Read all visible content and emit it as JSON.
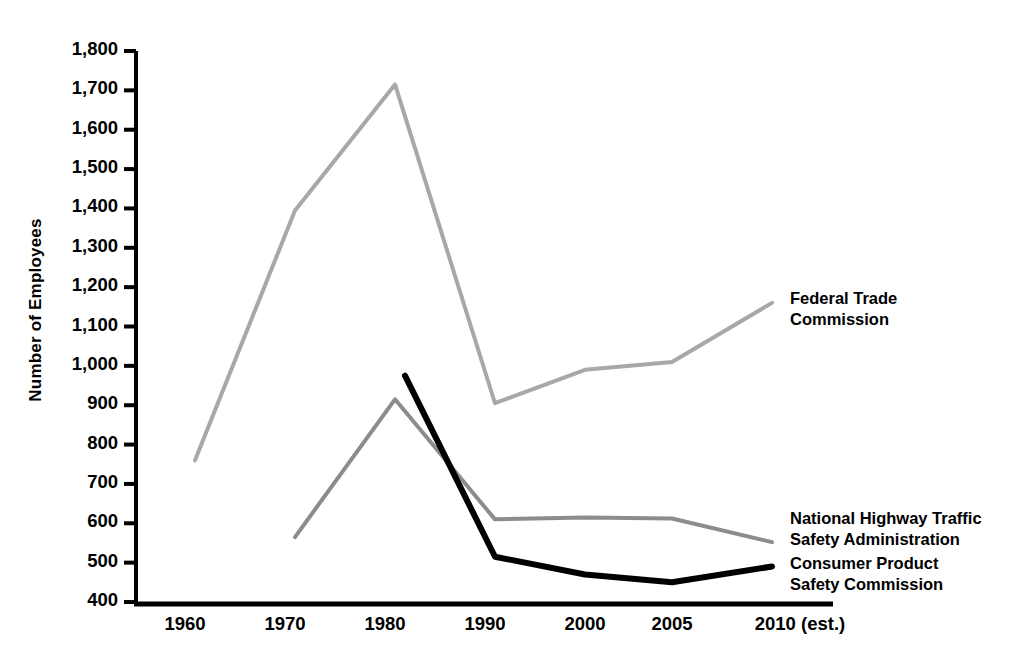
{
  "chart_data": {
    "type": "line",
    "title": "",
    "xlabel": "",
    "ylabel": "Number of Employees",
    "x": [
      1960,
      1970,
      1980,
      1990,
      2000,
      2005,
      2010
    ],
    "xticklabels": [
      "1960",
      "1970",
      "1980",
      "1990",
      "2000",
      "2005",
      "2010 (est.)"
    ],
    "yticklabels": [
      "1,800",
      "1,700",
      "1,600",
      "1,500",
      "1,400",
      "1,300",
      "1,200",
      "1,100",
      "1,000",
      "900",
      "800",
      "700",
      "600",
      "500",
      "400"
    ],
    "yticks": [
      1800,
      1700,
      1600,
      1500,
      1400,
      1300,
      1200,
      1100,
      1000,
      900,
      800,
      700,
      600,
      500,
      400
    ],
    "ylim": [
      400,
      1800
    ],
    "xlim": [
      1958,
      2012
    ],
    "grid": false,
    "legend_position": "right-inline-labels",
    "series": [
      {
        "name": "Federal Trade Commission",
        "color": "#a8a8a8",
        "linewidth": 4,
        "label_lines": [
          "Federal Trade",
          "Commission"
        ],
        "x": [
          1961,
          1971,
          1981,
          1991,
          2000,
          2005,
          2010
        ],
        "values": [
          760,
          1395,
          1715,
          905,
          990,
          1010,
          1160
        ]
      },
      {
        "name": "National Highway Traffic Safety Administration",
        "color": "#8c8c8c",
        "linewidth": 4,
        "label_lines": [
          "National Highway Traffic",
          "Safety Administration"
        ],
        "x": [
          1971,
          1981,
          1991,
          2000,
          2005,
          2010
        ],
        "values": [
          565,
          915,
          610,
          615,
          612,
          552
        ]
      },
      {
        "name": "Consumer Product Safety Commission",
        "color": "#000000",
        "linewidth": 6,
        "label_lines": [
          "Consumer Product",
          "Safety Commission"
        ],
        "x": [
          1982,
          1991,
          2000,
          2005,
          2010
        ],
        "values": [
          975,
          515,
          470,
          450,
          490
        ]
      }
    ],
    "annotations": [
      {
        "text": "Federal Trade Commission",
        "x": 2012,
        "y": 1140
      },
      {
        "text": "National Highway Traffic Safety Administration",
        "x": 2012,
        "y": 570
      },
      {
        "text": "Consumer Product Safety Commission",
        "x": 2012,
        "y": 490
      }
    ]
  },
  "axis": {
    "y_label": "Number of Employees"
  }
}
